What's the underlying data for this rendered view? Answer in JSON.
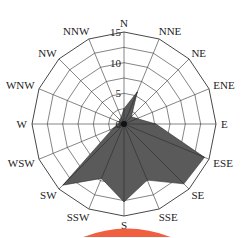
{
  "chart_data": {
    "type": "radar",
    "title": "",
    "categories": [
      "N",
      "NNE",
      "NE",
      "ENE",
      "E",
      "ESE",
      "SE",
      "SSE",
      "S",
      "SSW",
      "SW",
      "WSW",
      "W",
      "WNW",
      "NW",
      "NNW"
    ],
    "series": [
      {
        "name": "frequency",
        "values": [
          2.5,
          5.7,
          1.7,
          2.3,
          5.2,
          14.2,
          13.8,
          9.9,
          12.7,
          9.6,
          14.1,
          2.0,
          1.0,
          0.8,
          1.0,
          1.2
        ],
        "color": "#5a5a5a"
      }
    ],
    "radial_ticks": [
      0,
      5,
      10,
      15
    ],
    "rlim": [
      0,
      15
    ],
    "grid": "polygon",
    "legend": "none"
  },
  "colors": {
    "fill": "#5a5a5a",
    "grid": "#333333",
    "accent_arc": "#f06040"
  }
}
